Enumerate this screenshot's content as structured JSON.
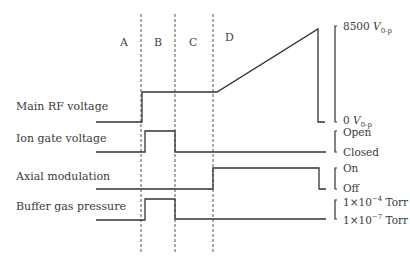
{
  "phases": [
    "A",
    "B",
    "C",
    "D"
  ],
  "signals": [
    {
      "label": "Main RF voltage",
      "high_label": "8500 V",
      "high_sub": "0-p",
      "low_label": "0 V",
      "low_sub": "0-p"
    },
    {
      "label": "Ion gate voltage",
      "high_label": "Open",
      "low_label": "Closed"
    },
    {
      "label": "Axial modulation",
      "high_label": "On",
      "low_label": "Off"
    },
    {
      "label": "Buffer gas pressure",
      "high_label": "1×10",
      "high_sup": "−4",
      "high_unit": " Torr",
      "low_label": "1×10",
      "low_sup": "−7",
      "low_unit": " Torr"
    }
  ],
  "colors": {
    "line": "#333333",
    "dashed": "#555555"
  }
}
